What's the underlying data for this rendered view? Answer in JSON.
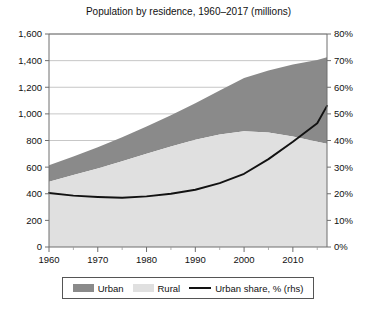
{
  "chart_data": {
    "type": "area",
    "title": "Population by residence, 1960–2017 (millions)",
    "xlabel": "",
    "ylabel": "",
    "x": [
      1960,
      1965,
      1970,
      1975,
      1980,
      1985,
      1990,
      1995,
      2000,
      2005,
      2010,
      2015,
      2017
    ],
    "xlim": [
      1960,
      2017
    ],
    "xticks": [
      1960,
      1970,
      1980,
      1990,
      2000,
      2010
    ],
    "xtick_labels": [
      "1960",
      "1970",
      "1980",
      "1990",
      "2000",
      "2010"
    ],
    "ylim": [
      0,
      1600
    ],
    "yticks": [
      0,
      200,
      400,
      600,
      800,
      1000,
      1200,
      1400,
      1600
    ],
    "ytick_labels": [
      "0",
      "200",
      "400",
      "600",
      "800",
      "1,000",
      "1,200",
      "1,400",
      "1,600"
    ],
    "y2lim": [
      0,
      80
    ],
    "y2ticks": [
      0,
      10,
      20,
      30,
      40,
      50,
      60,
      70,
      80
    ],
    "y2tick_labels": [
      "0%",
      "10%",
      "20%",
      "30%",
      "40%",
      "50%",
      "60%",
      "70%",
      "80%"
    ],
    "grid": true,
    "legend_position": "bottom",
    "stacked": true,
    "series": [
      {
        "name": "Rural",
        "kind": "area",
        "axis": "left",
        "color": "#e0e0e0",
        "values": [
          490,
          540,
          590,
          645,
          700,
          755,
          805,
          845,
          870,
          860,
          830,
          790,
          775
        ]
      },
      {
        "name": "Urban",
        "kind": "area",
        "axis": "left",
        "color": "#8a8a8a",
        "values": [
          125,
          140,
          160,
          180,
          205,
          235,
          275,
          330,
          400,
          465,
          540,
          615,
          650
        ]
      },
      {
        "name": "Urban share, % (rhs)",
        "kind": "line",
        "axis": "right",
        "color": "#121212",
        "values": [
          20.3,
          19.3,
          18.8,
          18.5,
          19.0,
          20.0,
          21.5,
          24.0,
          27.5,
          33.0,
          39.5,
          46.5,
          53.0
        ]
      }
    ],
    "series_display": {
      "rural_label": "Rural",
      "urban_label": "Urban",
      "share_label": "Urban share, % (rhs)"
    },
    "colors": {
      "urban": "#8a8a8a",
      "rural": "#e0e0e0",
      "share_line": "#121212",
      "grid": "#b9b9b9",
      "axis": "#6e6e6e",
      "background": "#ffffff"
    }
  },
  "legend": {
    "items": [
      {
        "label": "Urban",
        "marker": "swatch",
        "color": "#8a8a8a"
      },
      {
        "label": "Rural",
        "marker": "swatch",
        "color": "#e0e0e0"
      },
      {
        "label": "Urban share, % (rhs)",
        "marker": "line",
        "color": "#121212"
      }
    ]
  }
}
